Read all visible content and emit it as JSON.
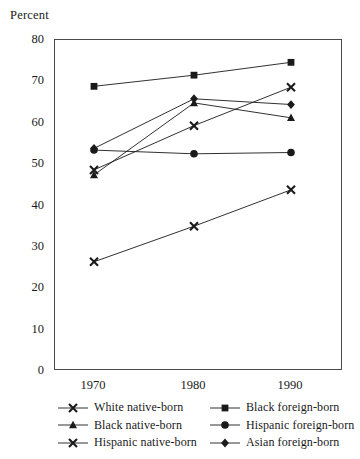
{
  "chart_data": {
    "type": "line",
    "title": "",
    "ylabel": "Percent",
    "xlabel": "",
    "categories": [
      "1970",
      "1980",
      "1990"
    ],
    "x": [
      1970,
      1980,
      1990
    ],
    "ylim": [
      0,
      80
    ],
    "yticks": [
      0,
      10,
      20,
      30,
      40,
      50,
      60,
      70,
      80
    ],
    "ytick_labels": [
      "0",
      "10",
      "20",
      "30",
      "40",
      "50",
      "60",
      "70",
      "80"
    ],
    "grid": false,
    "legend_position": "below-plot",
    "line_color": "#1a1a1a",
    "series": [
      {
        "name": "White native-born",
        "marker": "x",
        "values": [
          48.6,
          59.3,
          68.6
        ]
      },
      {
        "name": "Black native-born",
        "marker": "triangle",
        "values": [
          47.4,
          64.8,
          61.2
        ]
      },
      {
        "name": "Hispanic native-born",
        "marker": "x",
        "values": [
          26.4,
          35.0,
          43.8
        ]
      },
      {
        "name": "Black foreign-born",
        "marker": "square",
        "values": [
          68.8,
          71.5,
          74.6
        ]
      },
      {
        "name": "Hispanic foreign-born",
        "marker": "circle",
        "values": [
          53.4,
          52.5,
          52.8
        ]
      },
      {
        "name": "Asian foreign-born",
        "marker": "diamond",
        "values": [
          53.8,
          65.8,
          64.4
        ]
      }
    ]
  },
  "legend": {
    "left_column": [
      "White native-born",
      "Black native-born",
      "Hispanic native-born"
    ],
    "right_column": [
      "Black foreign-born",
      "Hispanic foreign-born",
      "Asian foreign-born"
    ]
  }
}
